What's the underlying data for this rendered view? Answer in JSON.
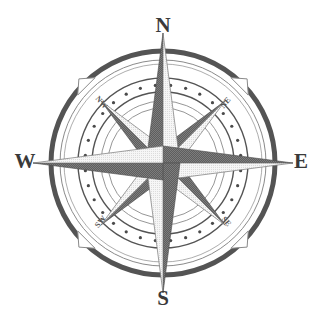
{
  "figure": {
    "name": "compass-rose",
    "width": 325,
    "height": 327,
    "background_color": "#ffffff"
  },
  "colors": {
    "dark": "#5e5e5e",
    "dark_outline": "#4a4a4a",
    "light": "#f4f4f4",
    "light_outline": "#777777",
    "ring_dark": "#545454",
    "ring_thin": "#8a8a8a",
    "dot": "#4a4a4a",
    "label": "#3a3a3a",
    "ordinal_label": "#555555"
  },
  "geometry": {
    "center_x": 163,
    "center_y": 163,
    "outer_ring_radius": 112,
    "outer_ring_width": 5,
    "inner_hairline_radius": 103,
    "dot_band_outer_radius": 85,
    "dot_band_inner_radius": 71,
    "dot_ring_radius": 78,
    "inner_circle_radius_1": 62,
    "inner_circle_radius_2": 55,
    "cardinal_point_length": 130,
    "cardinal_point_halfwidth": 17,
    "ordinal_point_length": 88,
    "ordinal_point_halfwidth": 13,
    "dot_count": 32,
    "dot_radius": 1.6
  },
  "cardinals": [
    {
      "label": "N",
      "angle_deg": 0,
      "label_x": 163,
      "label_y": 27
    },
    {
      "label": "E",
      "angle_deg": 90,
      "label_x": 301,
      "label_y": 163
    },
    {
      "label": "S",
      "angle_deg": 180,
      "label_x": 163,
      "label_y": 300
    },
    {
      "label": "W",
      "angle_deg": 270,
      "label_x": 25,
      "label_y": 163
    }
  ],
  "ordinals": [
    {
      "label": "NE",
      "angle_deg": 45,
      "label_x": 226,
      "label_y": 103,
      "rotation_deg": -50
    },
    {
      "label": "SE",
      "angle_deg": 135,
      "label_x": 226,
      "label_y": 222,
      "rotation_deg": 50
    },
    {
      "label": "SW",
      "angle_deg": 225,
      "label_x": 101,
      "label_y": 222,
      "rotation_deg": -50
    },
    {
      "label": "NW",
      "angle_deg": 315,
      "label_x": 101,
      "label_y": 103,
      "rotation_deg": 50
    }
  ],
  "edge_markers": [
    {
      "name": "marker-ne",
      "angle_deg": 45
    },
    {
      "name": "marker-se",
      "angle_deg": 135
    },
    {
      "name": "marker-sw",
      "angle_deg": 225
    },
    {
      "name": "marker-nw",
      "angle_deg": 315
    }
  ]
}
